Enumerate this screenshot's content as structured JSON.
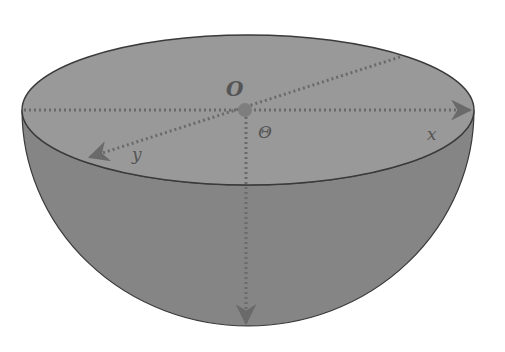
{
  "figure": {
    "type": "hemisphere-coordinate-diagram",
    "colors": {
      "background": "#ffffff",
      "top_face": "#999999",
      "bowl": "#858585",
      "outline": "#3a3a3a",
      "axis": "#6a6a6a",
      "origin_dot": "#7e7e7e",
      "label": "#555555"
    },
    "labels": {
      "origin": "O",
      "angle": "Θ",
      "x_axis": "x",
      "y_axis": "y"
    },
    "axes": [
      {
        "name": "x",
        "direction": "right",
        "style": "dotted-arrow"
      },
      {
        "name": "y",
        "direction": "front-left",
        "style": "dotted-arrow"
      },
      {
        "name": "z",
        "direction": "down",
        "style": "dotted-arrow"
      }
    ]
  }
}
